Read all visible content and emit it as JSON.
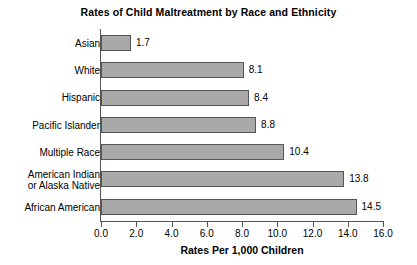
{
  "chart_data": {
    "type": "bar",
    "orientation": "horizontal",
    "title": "Rates of Child Maltreatment by Race and Ethnicity",
    "xlabel": "Rates Per 1,000 Children",
    "ylabel": "",
    "xlim": [
      0.0,
      16.0
    ],
    "xticks": [
      "0.0",
      "2.0",
      "4.0",
      "6.0",
      "8.0",
      "10.0",
      "12.0",
      "14.0",
      "16.0"
    ],
    "xtick_values": [
      0.0,
      2.0,
      4.0,
      6.0,
      8.0,
      10.0,
      12.0,
      14.0,
      16.0
    ],
    "grid": false,
    "legend": "none",
    "categories": [
      "Asian",
      "White",
      "Hispanic",
      "Pacific Islander",
      "Multiple Race",
      "American Indian\nor Alaska Native",
      "African American"
    ],
    "values": [
      1.7,
      8.1,
      8.4,
      8.8,
      10.4,
      13.8,
      14.5
    ],
    "value_labels": [
      "1.7",
      "8.1",
      "8.4",
      "8.8",
      "10.4",
      "13.8",
      "14.5"
    ],
    "bar_fill_color": "#a9a9a9",
    "bar_border_color": "#565656",
    "axis_color": "#555555",
    "background_color": "#ffffff",
    "text_color": "#000000"
  },
  "categories_display": [
    {
      "line1": "Asian",
      "line2": ""
    },
    {
      "line1": "White",
      "line2": ""
    },
    {
      "line1": "Hispanic",
      "line2": ""
    },
    {
      "line1": "Pacific Islander",
      "line2": ""
    },
    {
      "line1": "Multiple Race",
      "line2": ""
    },
    {
      "line1": "American Indian",
      "line2": "or Alaska Native"
    },
    {
      "line1": "African American",
      "line2": ""
    }
  ]
}
